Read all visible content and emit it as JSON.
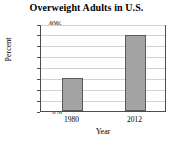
{
  "chart_data": {
    "type": "bar",
    "title": "Overweight Adults in U.S.",
    "xlabel": "Year",
    "ylabel": "Percent",
    "categories": [
      "1980",
      "2012"
    ],
    "values": [
      15,
      35
    ],
    "ylim": [
      0,
      40
    ],
    "ytick_labels": [
      "0%",
      "5%",
      "10%",
      "15%",
      "20%",
      "25%",
      "30%",
      "35%",
      "40%"
    ],
    "ytick_values": [
      0,
      5,
      10,
      15,
      20,
      25,
      30,
      35,
      40
    ],
    "grid": true,
    "legend": false,
    "bar_color": "#a3a3a3",
    "bar_edge_color": "#5a5a5a",
    "axis_color": "#4d4d4d",
    "gridline_color": "#d2d2d2",
    "background_color": "#ffffff"
  }
}
